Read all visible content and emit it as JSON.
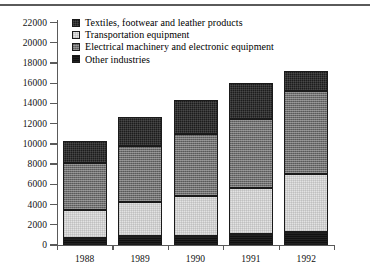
{
  "chart_data": {
    "type": "bar",
    "subtype": "stacked-bar",
    "title": "",
    "xlabel": "",
    "ylabel": "",
    "categories": [
      "1988",
      "1989",
      "1990",
      "1991",
      "1992"
    ],
    "ylim": [
      0,
      22000
    ],
    "ytick_step": 2000,
    "yticks": [
      "0",
      "2000",
      "4000",
      "6000",
      "8000",
      "10000",
      "12000",
      "14000",
      "16000",
      "18000",
      "20000",
      "22000"
    ],
    "grid": false,
    "legend_position": "top-left-inside",
    "stack_order_bottom_to_top": [
      "Other industries",
      "Transportation equipment",
      "Electrical machinery and electronic equipment",
      "Textiles, footwear and leather products"
    ],
    "series": [
      {
        "name": "Other industries",
        "key": "other",
        "color": "#111111",
        "values": [
          700,
          900,
          900,
          1100,
          1250
        ]
      },
      {
        "name": "Transportation equipment",
        "key": "transport",
        "color": "#e3e3e3",
        "values": [
          2800,
          3350,
          3900,
          4550,
          5800
        ]
      },
      {
        "name": "Electrical machinery and electronic equipment",
        "key": "electrical",
        "color": "#6f6f6f",
        "values": [
          4600,
          5550,
          6200,
          6800,
          8150
        ]
      },
      {
        "name": "Textiles, footwear and leather products",
        "key": "textiles",
        "color": "#1c1c1c",
        "values": [
          2200,
          2850,
          3300,
          3550,
          2000
        ]
      }
    ],
    "cumulative_tops": {
      "other": [
        700,
        900,
        900,
        1100,
        1250
      ],
      "transport": [
        3500,
        4250,
        4800,
        5650,
        7050
      ],
      "electrical": [
        8100,
        9800,
        11000,
        12450,
        15200
      ],
      "textiles": [
        10300,
        12650,
        14300,
        16000,
        17200
      ]
    },
    "totals": [
      10300,
      12650,
      14300,
      16000,
      17200
    ]
  },
  "legend": {
    "items": [
      {
        "label": "Textiles, footwear and leather products",
        "swatch": "textiles"
      },
      {
        "label": "Transportation equipment",
        "swatch": "transport"
      },
      {
        "label": "Electrical machinery and electronic equipment",
        "swatch": "electrical"
      },
      {
        "label": "Other industries",
        "swatch": "other"
      }
    ]
  }
}
